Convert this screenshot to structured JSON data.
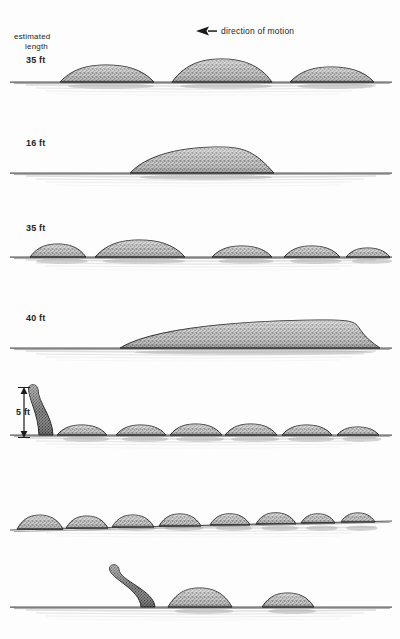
{
  "figure": {
    "title_lines": [
      "estimated",
      "length"
    ],
    "direction_label": "direction of motion",
    "direction_arrow_icon": "arrow-left-icon",
    "scale_label": "5 ft",
    "background_color": "#fdfdfd",
    "ink_color": "#1a1a1a",
    "water_color": "#8d8d8d",
    "hump_fill_color": "#9a9a9a"
  },
  "rows": [
    {
      "id": "row-1",
      "length_label": "35 ft",
      "waterline_y": 82,
      "description": "three humps, middle largest",
      "neck": null,
      "humps": [
        {
          "cx": 107,
          "half_width": 47,
          "height": 17
        },
        {
          "cx": 222,
          "half_width": 50,
          "height": 23
        },
        {
          "cx": 332,
          "half_width": 42,
          "height": 15
        }
      ]
    },
    {
      "id": "row-2",
      "length_label": "16 ft",
      "waterline_y": 173,
      "description": "single long asymmetric hump",
      "neck": null,
      "humps": [
        {
          "cx": 202,
          "half_width": 72,
          "height": 26,
          "skew": 0.3
        }
      ]
    },
    {
      "id": "row-3",
      "length_label": "35 ft",
      "waterline_y": 257,
      "description": "five humps, second largest",
      "neck": null,
      "humps": [
        {
          "cx": 58,
          "half_width": 28,
          "height": 13
        },
        {
          "cx": 140,
          "half_width": 45,
          "height": 17
        },
        {
          "cx": 242,
          "half_width": 30,
          "height": 11
        },
        {
          "cx": 312,
          "half_width": 28,
          "height": 11
        },
        {
          "cx": 368,
          "half_width": 22,
          "height": 9
        }
      ]
    },
    {
      "id": "row-4",
      "length_label": "40 ft",
      "waterline_y": 348,
      "description": "long tapering wedge peaking near right",
      "neck": null,
      "humps": [
        {
          "cx": 250,
          "half_width": 130,
          "height": 28,
          "skew": 0.72
        }
      ]
    },
    {
      "id": "row-5",
      "length_label": "",
      "waterline_y": 435,
      "description": "raised neck at left plus six small humps",
      "neck": {
        "base_x": 44,
        "height": 48,
        "lean": -9
      },
      "humps": [
        {
          "cx": 82,
          "half_width": 25,
          "height": 10
        },
        {
          "cx": 141,
          "half_width": 25,
          "height": 10
        },
        {
          "cx": 196,
          "half_width": 26,
          "height": 11
        },
        {
          "cx": 251,
          "half_width": 26,
          "height": 11
        },
        {
          "cx": 307,
          "half_width": 25,
          "height": 10
        },
        {
          "cx": 358,
          "half_width": 21,
          "height": 8
        }
      ]
    },
    {
      "id": "row-6",
      "length_label": "",
      "waterline_y": 524,
      "description": "eight humps of gradually decreasing size",
      "neck": null,
      "humps": [
        {
          "cx": 40,
          "half_width": 23,
          "height": 14
        },
        {
          "cx": 87,
          "half_width": 21,
          "height": 12
        },
        {
          "cx": 133,
          "half_width": 21,
          "height": 12
        },
        {
          "cx": 180,
          "half_width": 21,
          "height": 12
        },
        {
          "cx": 230,
          "half_width": 20,
          "height": 11
        },
        {
          "cx": 276,
          "half_width": 20,
          "height": 11
        },
        {
          "cx": 318,
          "half_width": 17,
          "height": 9
        },
        {
          "cx": 358,
          "half_width": 17,
          "height": 9
        }
      ]
    },
    {
      "id": "row-7",
      "length_label": "",
      "waterline_y": 607,
      "description": "neck curving left with two humps behind",
      "neck": {
        "base_x": 146,
        "height": 40,
        "lean": -30
      },
      "humps": [
        {
          "cx": 200,
          "half_width": 32,
          "height": 19
        },
        {
          "cx": 288,
          "half_width": 26,
          "height": 14
        }
      ]
    }
  ]
}
